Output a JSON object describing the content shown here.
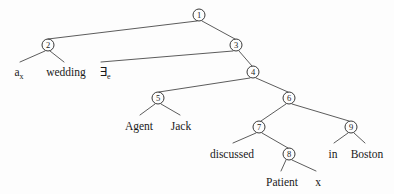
{
  "figure": {
    "kind": "syntax-tree",
    "background_color": "#fdfdfd",
    "line_color": "#4a4a4a",
    "text_color": "#1a1a1a"
  },
  "nodes": [
    {
      "id": "n1",
      "label": "①",
      "number": "1",
      "x": 199,
      "y": 15
    },
    {
      "id": "n2",
      "label": "②",
      "number": "2",
      "x": 48,
      "y": 45
    },
    {
      "id": "n3",
      "label": "③",
      "number": "3",
      "x": 236,
      "y": 45
    },
    {
      "id": "n4",
      "label": "④",
      "number": "4",
      "x": 253,
      "y": 72
    },
    {
      "id": "n5",
      "label": "⑤",
      "number": "5",
      "x": 158,
      "y": 98
    },
    {
      "id": "n6",
      "label": "⑥",
      "number": "6",
      "x": 289,
      "y": 98
    },
    {
      "id": "n7",
      "label": "⑦",
      "number": "7",
      "x": 259,
      "y": 127
    },
    {
      "id": "n8",
      "label": "⑧",
      "number": "8",
      "x": 289,
      "y": 154
    },
    {
      "id": "n9",
      "label": "⑨",
      "number": "9",
      "x": 351,
      "y": 127
    }
  ],
  "leaves": [
    {
      "id": "l_a",
      "text": "a",
      "sub": "x",
      "x": 19,
      "y": 66
    },
    {
      "id": "l_wedding",
      "text": "wedding",
      "sub": "",
      "x": 66,
      "y": 66
    },
    {
      "id": "l_exists",
      "text": "∃",
      "sub": "e",
      "x": 105,
      "y": 66
    },
    {
      "id": "l_agent",
      "text": "Agent",
      "sub": "",
      "x": 139,
      "y": 120
    },
    {
      "id": "l_jack",
      "text": "Jack",
      "sub": "",
      "x": 181,
      "y": 120
    },
    {
      "id": "l_discussed",
      "text": "discussed",
      "sub": "",
      "x": 232,
      "y": 148
    },
    {
      "id": "l_in",
      "text": "in",
      "sub": "",
      "x": 333,
      "y": 148
    },
    {
      "id": "l_boston",
      "text": "Boston",
      "sub": "",
      "x": 367,
      "y": 148
    },
    {
      "id": "l_patient",
      "text": "Patient",
      "sub": "",
      "x": 282,
      "y": 176
    },
    {
      "id": "l_x",
      "text": "x",
      "sub": "",
      "x": 318,
      "y": 176
    }
  ],
  "edges": [
    {
      "id": "e1",
      "from": "n1",
      "to": "n2",
      "x1": 197,
      "y1": 21,
      "x2": 48,
      "y2": 39
    },
    {
      "id": "e2",
      "from": "n1",
      "to": "n3",
      "x1": 202,
      "y1": 21,
      "x2": 235,
      "y2": 39
    },
    {
      "id": "e3",
      "from": "n2",
      "to": "l_a",
      "x1": 45,
      "y1": 51,
      "x2": 20,
      "y2": 62
    },
    {
      "id": "e4",
      "from": "n2",
      "to": "l_wedding",
      "x1": 50,
      "y1": 51,
      "x2": 64,
      "y2": 62
    },
    {
      "id": "e5",
      "from": "n3",
      "to": "l_exists",
      "x1": 233,
      "y1": 51,
      "x2": 101,
      "y2": 62
    },
    {
      "id": "e6",
      "from": "n3",
      "to": "n4",
      "x1": 239,
      "y1": 51,
      "x2": 252,
      "y2": 66
    },
    {
      "id": "e7",
      "from": "n4",
      "to": "n5",
      "x1": 250,
      "y1": 78,
      "x2": 159,
      "y2": 92
    },
    {
      "id": "e8",
      "from": "n4",
      "to": "n6",
      "x1": 256,
      "y1": 78,
      "x2": 288,
      "y2": 92
    },
    {
      "id": "e9",
      "from": "n5",
      "to": "l_agent",
      "x1": 155,
      "y1": 104,
      "x2": 140,
      "y2": 115
    },
    {
      "id": "e10",
      "from": "n5",
      "to": "l_jack",
      "x1": 161,
      "y1": 104,
      "x2": 180,
      "y2": 115
    },
    {
      "id": "e11",
      "from": "n6",
      "to": "n7",
      "x1": 286,
      "y1": 104,
      "x2": 261,
      "y2": 121
    },
    {
      "id": "e12",
      "from": "n6",
      "to": "n9",
      "x1": 292,
      "y1": 104,
      "x2": 349,
      "y2": 121
    },
    {
      "id": "e13",
      "from": "n7",
      "to": "l_discussed",
      "x1": 256,
      "y1": 133,
      "x2": 233,
      "y2": 143
    },
    {
      "id": "e14",
      "from": "n7",
      "to": "n8",
      "x1": 262,
      "y1": 133,
      "x2": 288,
      "y2": 148
    },
    {
      "id": "e15",
      "from": "n9",
      "to": "l_in",
      "x1": 348,
      "y1": 133,
      "x2": 334,
      "y2": 143
    },
    {
      "id": "e16",
      "from": "n9",
      "to": "l_boston",
      "x1": 354,
      "y1": 133,
      "x2": 365,
      "y2": 143
    },
    {
      "id": "e17",
      "from": "n8",
      "to": "l_patient",
      "x1": 286,
      "y1": 160,
      "x2": 281,
      "y2": 171
    },
    {
      "id": "e18",
      "from": "n8",
      "to": "l_x",
      "x1": 292,
      "y1": 160,
      "x2": 316,
      "y2": 171
    }
  ]
}
